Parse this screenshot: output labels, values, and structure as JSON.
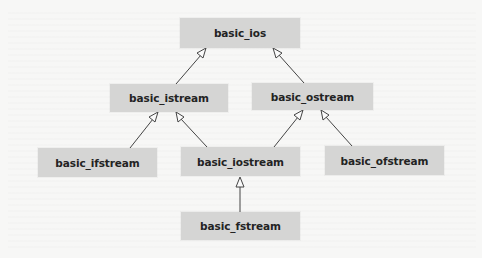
{
  "diagram": {
    "type": "class-inheritance",
    "nodes": [
      {
        "id": "basic_ios",
        "label": "basic_ios",
        "x": 180,
        "y": 18,
        "w": 120,
        "h": 30
      },
      {
        "id": "basic_istream",
        "label": "basic_istream",
        "x": 110,
        "y": 84,
        "w": 118,
        "h": 28
      },
      {
        "id": "basic_ostream",
        "label": "basic_ostream",
        "x": 252,
        "y": 83,
        "w": 121,
        "h": 27
      },
      {
        "id": "basic_ifstream",
        "label": "basic_ifstream",
        "x": 38,
        "y": 148,
        "w": 119,
        "h": 29
      },
      {
        "id": "basic_iostream",
        "label": "basic_iostream",
        "x": 181,
        "y": 147,
        "w": 119,
        "h": 29
      },
      {
        "id": "basic_ofstream",
        "label": "basic_ofstream",
        "x": 325,
        "y": 146,
        "w": 119,
        "h": 29
      },
      {
        "id": "basic_fstream",
        "label": "basic_fstream",
        "x": 181,
        "y": 212,
        "w": 119,
        "h": 28
      }
    ],
    "edges": [
      {
        "from": "basic_istream",
        "to": "basic_ios"
      },
      {
        "from": "basic_ostream",
        "to": "basic_ios"
      },
      {
        "from": "basic_ifstream",
        "to": "basic_istream"
      },
      {
        "from": "basic_iostream",
        "to": "basic_istream"
      },
      {
        "from": "basic_iostream",
        "to": "basic_ostream"
      },
      {
        "from": "basic_ofstream",
        "to": "basic_ostream"
      },
      {
        "from": "basic_fstream",
        "to": "basic_iostream"
      }
    ],
    "colors": {
      "node_fill": "#d5d5d4",
      "node_text": "#232323",
      "edge": "#444444",
      "background": "#f7f7f6"
    }
  }
}
